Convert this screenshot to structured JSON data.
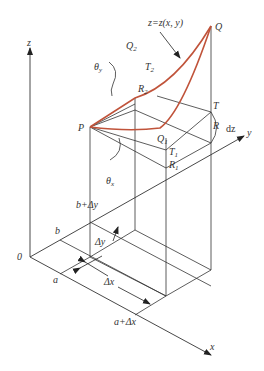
{
  "diagram": {
    "colors": {
      "line": "#333333",
      "surface": "#c0533a"
    },
    "axes": {
      "x": "x",
      "y": "y",
      "z": "z",
      "origin": "0"
    },
    "points": {
      "P": "P",
      "Q": "Q",
      "Q1": "Q",
      "Q1_sub": "1",
      "Q2": "Q",
      "Q2_sub": "2",
      "R": "R",
      "R1": "R",
      "R1_sub": "1",
      "R2": "R",
      "R2_sub": "2",
      "T": "T",
      "T1": "T",
      "T1_sub": "1",
      "T2": "T",
      "T2_sub": "2"
    },
    "surface_label": "z=z(x, y)",
    "angles": {
      "theta_y": "θ",
      "theta_y_sub": "y",
      "theta_x": "θ",
      "theta_x_sub": "x"
    },
    "dz_label": "dz",
    "ticks": {
      "a": "a",
      "a_plus_dx": "a+Δx",
      "b": "b",
      "b_plus_dy": "b+Δy"
    },
    "intervals": {
      "dx": "Δx",
      "dy": "Δy"
    }
  }
}
